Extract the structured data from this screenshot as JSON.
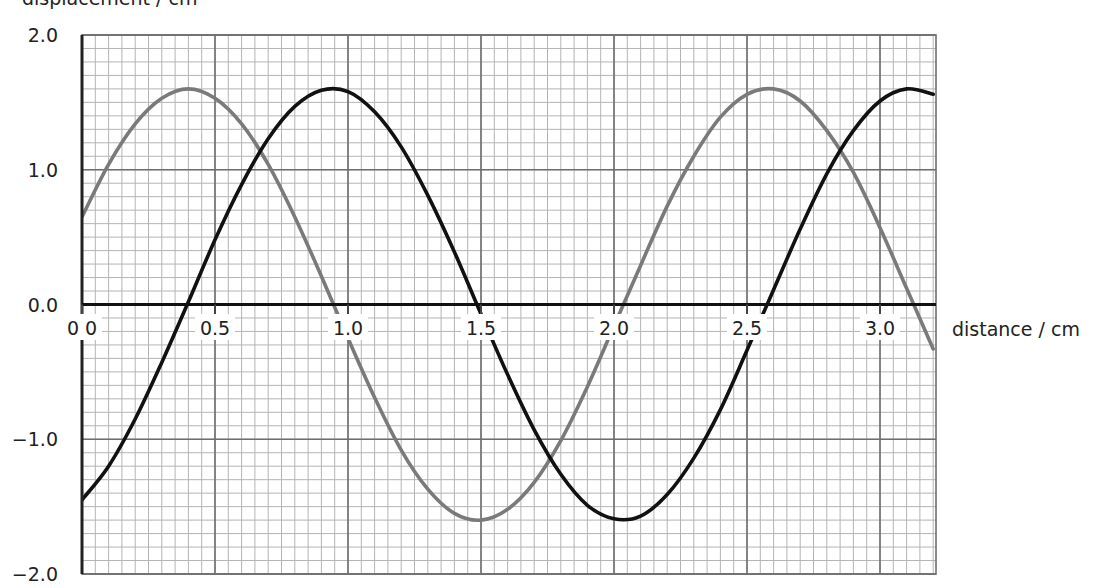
{
  "chart_data": {
    "type": "line",
    "title": "",
    "xlabel": "distance / cm",
    "ylabel": "displacement / cm",
    "xlim": [
      0.0,
      3.21
    ],
    "ylim": [
      -2.0,
      2.0
    ],
    "grid": true,
    "legend": null,
    "x_ticks": [
      "0.0",
      "0.5",
      "1.0",
      "1.5",
      "2.0",
      "2.5",
      "3.0"
    ],
    "x_tick_values": [
      0.0,
      0.5,
      1.0,
      1.5,
      2.0,
      2.5,
      3.0
    ],
    "y_ticks": [
      "2.0",
      "1.0",
      "0.0",
      "−1.0",
      "−2.0"
    ],
    "y_tick_values": [
      2.0,
      1.0,
      0.0,
      -1.0,
      -2.0
    ],
    "x": [
      0.0,
      0.1,
      0.2,
      0.3,
      0.4,
      0.5,
      0.6,
      0.7,
      0.8,
      0.9,
      1.0,
      1.1,
      1.2,
      1.3,
      1.4,
      1.5,
      1.6,
      1.7,
      1.8,
      1.9,
      2.0,
      2.1,
      2.2,
      2.3,
      2.4,
      2.5,
      2.6,
      2.7,
      2.8,
      2.9,
      3.0,
      3.1,
      3.2
    ],
    "series": [
      {
        "name": "wave A (grey)",
        "color": "#7a7a7a",
        "values": [
          0.65,
          1.04,
          1.34,
          1.53,
          1.6,
          1.53,
          1.34,
          1.04,
          0.65,
          0.21,
          -0.25,
          -0.69,
          -1.08,
          -1.37,
          -1.55,
          -1.6,
          -1.52,
          -1.32,
          -1.01,
          -0.61,
          -0.16,
          0.29,
          0.73,
          1.1,
          1.39,
          1.56,
          1.6,
          1.51,
          1.29,
          0.98,
          0.57,
          0.12,
          -0.33
        ]
      },
      {
        "name": "wave B (black)",
        "color": "#111111",
        "values": [
          -1.45,
          -1.2,
          -0.85,
          -0.43,
          0.02,
          0.48,
          0.89,
          1.23,
          1.47,
          1.59,
          1.58,
          1.43,
          1.17,
          0.81,
          0.39,
          -0.07,
          -0.52,
          -0.93,
          -1.26,
          -1.49,
          -1.59,
          -1.57,
          -1.41,
          -1.14,
          -0.78,
          -0.34,
          0.11,
          0.56,
          0.97,
          1.29,
          1.51,
          1.6,
          1.56
        ]
      }
    ],
    "amplitude": 1.6,
    "wavelength_cm": 2.18
  },
  "labels": {
    "y_axis_title": "displacement / cm",
    "x_axis_title": "distance / cm"
  }
}
